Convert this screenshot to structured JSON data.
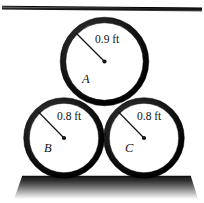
{
  "figure": {
    "background_color": "#ffffff",
    "ink_color": "#161616",
    "ground_color": "#2b2b2b",
    "ceiling": {
      "name": "ceiling-line",
      "label": ""
    },
    "ground": {
      "name": "ground-surface",
      "label": ""
    },
    "circles": [
      {
        "id": "A",
        "id_label": "A",
        "dimension_label": "0.9 ft",
        "cx": 104.5,
        "cy": 61.5,
        "r": 41.5,
        "ring_width": 5.5,
        "leader": {
          "x1": 76.0,
          "y1": 33.0,
          "x2": 104.5,
          "y2": 61.5
        },
        "dim_text_pos": {
          "x": 95,
          "y": 43
        },
        "id_text_pos": {
          "x": 82,
          "y": 83
        }
      },
      {
        "id": "B",
        "id_label": "B",
        "dimension_label": "0.8 ft",
        "cx": 64.0,
        "cy": 138.0,
        "r": 37.5,
        "ring_width": 5.5,
        "leader": {
          "x1": 38.5,
          "y1": 112.0,
          "x2": 64.0,
          "y2": 138.0
        },
        "dim_text_pos": {
          "x": 57,
          "y": 120
        },
        "id_text_pos": {
          "x": 44,
          "y": 152
        }
      },
      {
        "id": "C",
        "id_label": "C",
        "dimension_label": "0.8 ft",
        "cx": 144.0,
        "cy": 138.0,
        "r": 37.5,
        "ring_width": 5.5,
        "leader": {
          "x1": 118.5,
          "y1": 112.0,
          "x2": 144.0,
          "y2": 138.0
        },
        "dim_text_pos": {
          "x": 137,
          "y": 120
        },
        "id_text_pos": {
          "x": 125,
          "y": 152
        }
      }
    ]
  }
}
